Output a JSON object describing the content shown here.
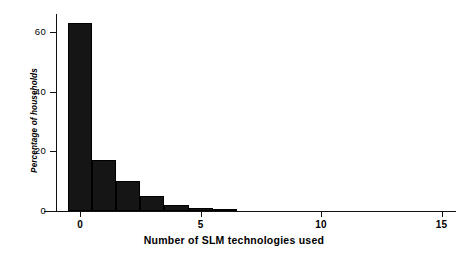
{
  "chart_data": {
    "type": "bar",
    "title": "",
    "subtitle": "",
    "xlabel": "Number of SLM technologies used",
    "ylabel": "Percentage of households",
    "categories": [
      0,
      1,
      2,
      3,
      4,
      5,
      6
    ],
    "values": [
      63,
      17,
      10,
      5,
      2,
      1,
      0.3
    ],
    "series": [
      {
        "name": "Percentage of households",
        "values": [
          63,
          17,
          10,
          5,
          2,
          1,
          0.3
        ]
      }
    ],
    "xlim": [
      -1,
      15.6
    ],
    "ylim": [
      0,
      66
    ],
    "xticks": [
      0,
      5,
      10,
      15
    ],
    "xtick_labels": [
      "0",
      "5",
      "10",
      "15"
    ],
    "yticks": [
      0,
      20,
      40,
      60
    ],
    "ytick_labels": [
      "0",
      "20",
      "40",
      "60"
    ],
    "grid": false,
    "legend": false,
    "legend_position": "none",
    "bar_color": "#151515",
    "axis_color": "#111111",
    "background_color": "#ffffff",
    "bar_width": 1
  }
}
